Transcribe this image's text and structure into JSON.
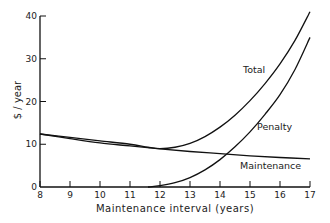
{
  "chart_data": {
    "type": "line",
    "title": "",
    "xlabel": "Maintenance interval (years)",
    "ylabel": "$ / year",
    "xlim": [
      8,
      17
    ],
    "ylim": [
      0,
      40
    ],
    "x_ticks": [
      8,
      9,
      10,
      11,
      12,
      13,
      14,
      15,
      16,
      17
    ],
    "y_ticks": [
      0,
      10,
      20,
      30,
      40
    ],
    "grid": false,
    "legend": "inline labels",
    "series": [
      {
        "name": "Total",
        "label_pos": [
          13.4,
          27
        ],
        "x": [
          8,
          9,
          10,
          11,
          11.6,
          12,
          12.5,
          13,
          13.5,
          14,
          14.5,
          15,
          15.5,
          16,
          16.5,
          17
        ],
        "values": [
          12.4,
          11.6,
          10.8,
          10.0,
          9.3,
          9.0,
          9.3,
          10.2,
          11.8,
          14.0,
          16.8,
          20.2,
          24.2,
          28.8,
          34.3,
          41.0
        ]
      },
      {
        "name": "Penalty",
        "label_pos": [
          15.1,
          13.5
        ],
        "x": [
          11.6,
          12,
          12.5,
          13,
          13.5,
          14,
          14.5,
          15,
          15.5,
          16,
          16.5,
          17
        ],
        "values": [
          0,
          0.3,
          1.0,
          2.2,
          4.0,
          6.4,
          9.4,
          12.9,
          17.0,
          21.6,
          27.5,
          35.0
        ]
      },
      {
        "name": "Maintenance",
        "label_pos": [
          15.0,
          4.0
        ],
        "x": [
          8,
          9,
          10,
          11,
          12,
          13,
          14,
          15,
          16,
          17
        ],
        "values": [
          12.4,
          11.3,
          10.3,
          9.6,
          8.9,
          8.3,
          7.8,
          7.3,
          6.9,
          6.6
        ]
      }
    ]
  },
  "labels": {
    "xlabel": "Maintenance interval (years)",
    "ylabel": "$ / year",
    "total": "Total",
    "penalty": "Penalty",
    "maintenance": "Maintenance"
  }
}
